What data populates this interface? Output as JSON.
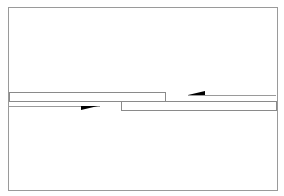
{
  "diagram": {
    "type": "schematic",
    "colors": {
      "background": "#ffffff",
      "frame": "#9a9a9a",
      "bar_stroke": "#8a8a8a",
      "line": "#9a9a9a",
      "arrow": "#000000"
    },
    "elements": {
      "frame": {
        "x": 8,
        "y": 7,
        "w": 269,
        "h": 183
      },
      "left_bar": {
        "x": 9,
        "y": 92,
        "w": 156,
        "h": 9
      },
      "left_line": {
        "x1": 9,
        "y1": 106,
        "x2": 100,
        "y2": 106
      },
      "left_arrow": {
        "direction": "right",
        "points": "81,106 98,106 81,110"
      },
      "right_bar": {
        "x": 121,
        "y": 101,
        "w": 155,
        "h": 9
      },
      "right_line": {
        "x1": 188,
        "y1": 95,
        "x2": 276,
        "y2": 95
      },
      "right_arrow": {
        "direction": "left",
        "points": "188,95 205,95 205,91"
      }
    }
  }
}
